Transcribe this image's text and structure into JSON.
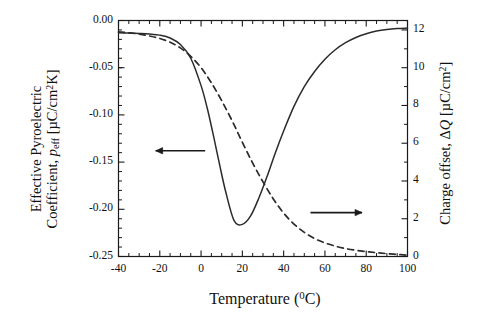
{
  "figure": {
    "background": "#ffffff",
    "foreground": "#1a1a1a"
  },
  "axes": {
    "left": {
      "label_line1": "Effective Pyroelectric",
      "label_line2_pre": "Coefficient, ",
      "label_line2_sym": "p",
      "label_line2_sub": "eff",
      "label_line2_unit_pre": " [µC/cm",
      "label_line2_unit_sup": "2",
      "label_line2_unit_post": "K]",
      "ticks": [
        "0.00",
        "-0.05",
        "-0.10",
        "-0.15",
        "-0.20",
        "-0.25"
      ],
      "tick_values": [
        0.0,
        -0.05,
        -0.1,
        -0.15,
        -0.2,
        -0.25
      ],
      "range": [
        -0.25,
        0.0
      ]
    },
    "right": {
      "label_pre": "Charge offset, ",
      "label_delta": "Δ",
      "label_sym": "Q",
      "label_unit_pre": " [µC/cm",
      "label_unit_sup": "2",
      "label_unit_post": "]",
      "ticks": [
        "0",
        "2",
        "4",
        "6",
        "8",
        "10",
        "12"
      ],
      "tick_values": [
        0,
        2,
        4,
        6,
        8,
        10,
        12
      ],
      "range": [
        0,
        12.5
      ]
    },
    "bottom": {
      "label_pre": "Temperature (",
      "label_sup": "0",
      "label_post": "C)",
      "ticks": [
        "-40",
        "-20",
        "0",
        "20",
        "40",
        "60",
        "80",
        "100"
      ],
      "tick_values": [
        -40,
        -20,
        0,
        20,
        40,
        60,
        80,
        100
      ],
      "range": [
        -40,
        100
      ]
    }
  },
  "chart_data": {
    "type": "line",
    "title": "",
    "xlabel": "Temperature (°C)",
    "ylabel": "Effective Pyroelectric Coefficient, p_eff [µC/cm^2K]",
    "y2label": "Charge offset, ΔQ [µC/cm^2]",
    "xlim": [
      -40,
      100
    ],
    "ylim": [
      -0.25,
      0.0
    ],
    "y2lim": [
      0,
      12.5
    ],
    "grid": false,
    "legend": null,
    "series": [
      {
        "name": "Effective pyroelectric coefficient",
        "axis": "left",
        "style": "solid",
        "color": "#2b2b2b",
        "x": [
          -40,
          -35,
          -30,
          -25,
          -20,
          -15,
          -10,
          -5,
          0,
          3,
          6,
          9,
          12,
          16,
          20,
          24,
          28,
          32,
          36,
          40,
          45,
          50,
          55,
          60,
          65,
          70,
          75,
          80,
          85,
          90,
          95,
          100
        ],
        "y": [
          -0.013,
          -0.0133,
          -0.0137,
          -0.0143,
          -0.0155,
          -0.0185,
          -0.0255,
          -0.04,
          -0.069,
          -0.093,
          -0.122,
          -0.153,
          -0.182,
          -0.212,
          -0.216,
          -0.207,
          -0.188,
          -0.165,
          -0.14,
          -0.117,
          -0.091,
          -0.07,
          -0.054,
          -0.041,
          -0.031,
          -0.0235,
          -0.018,
          -0.014,
          -0.0112,
          -0.0095,
          -0.0085,
          -0.008
        ]
      },
      {
        "name": "Charge offset",
        "axis": "right",
        "style": "dashed",
        "color": "#2b2b2b",
        "x": [
          -40,
          -35,
          -30,
          -25,
          -20,
          -15,
          -10,
          -5,
          0,
          5,
          10,
          15,
          20,
          25,
          30,
          35,
          40,
          45,
          50,
          55,
          60,
          65,
          70,
          75,
          80,
          85,
          90,
          95,
          100
        ],
        "y2": [
          11.9,
          11.85,
          11.78,
          11.68,
          11.55,
          11.35,
          11.05,
          10.6,
          10.0,
          9.2,
          8.25,
          7.2,
          6.05,
          4.95,
          3.95,
          3.05,
          2.3,
          1.72,
          1.28,
          0.95,
          0.72,
          0.55,
          0.42,
          0.33,
          0.26,
          0.2,
          0.15,
          0.11,
          0.07
        ]
      }
    ],
    "annotations": [
      {
        "name": "left-arrow-annotation",
        "type": "arrow",
        "direction": "left",
        "x_from": 2,
        "x_to": -22,
        "y": -0.138,
        "axis": "left"
      },
      {
        "name": "right-arrow-annotation",
        "type": "arrow",
        "direction": "right",
        "x_from": 53,
        "x_to": 78,
        "y": -0.2035,
        "axis": "left"
      }
    ]
  }
}
